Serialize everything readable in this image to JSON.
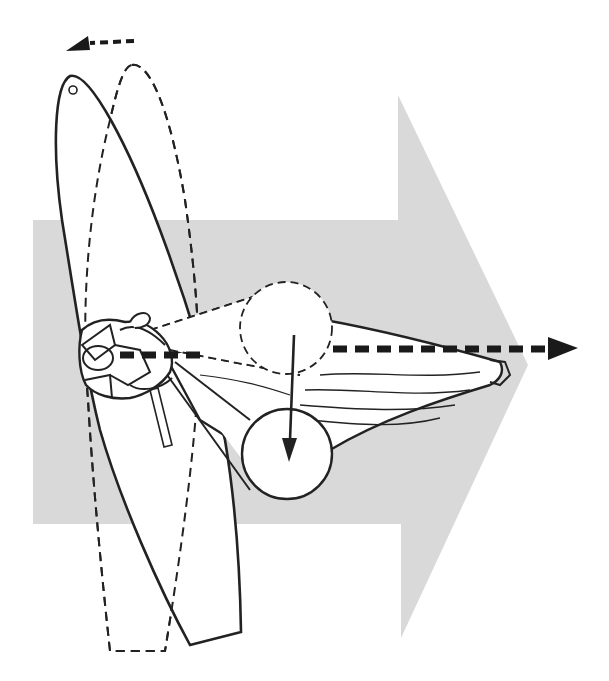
{
  "diagram": {
    "title": "Windsurfing maneuver: sail rotation and direction of travel",
    "colors": {
      "background": "#ffffff",
      "big_arrow_fill": "#d9d9d9",
      "line": "#222222",
      "dash_arrow": "#1a1a1a",
      "board_fill": "#ffffff"
    },
    "elements": {
      "big_arrow": "direction-of-travel-arrow",
      "board_solid": "board-current-position",
      "board_dashed": "board-previous-position",
      "rotation_arrow": "board-rotation-arrow (curved dashed, pointing left)",
      "heading_arrow": "heading-dashed-arrow (pointing right)",
      "sail": "rig-sail",
      "circle_dashed": "mast-top-previous-position",
      "circle_solid": "mast-top-current-position",
      "movement_arrow": "mast-downward-motion-arrow",
      "sailor": "sailor-top-view",
      "daggerboard": "daggerboard"
    }
  }
}
